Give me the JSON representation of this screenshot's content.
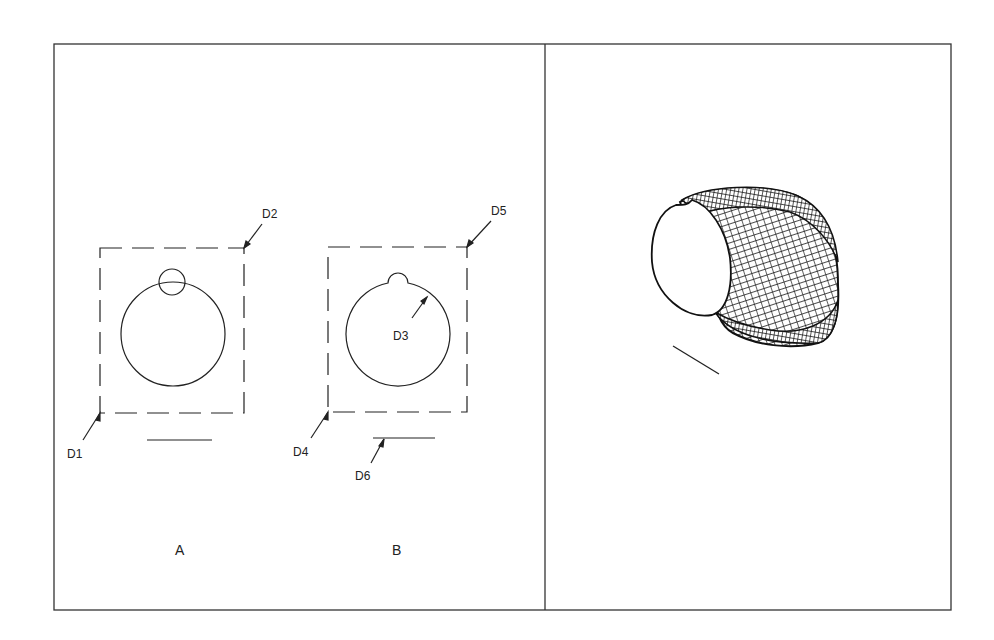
{
  "figure": {
    "panels": [
      {
        "id": "left",
        "description": "2D profile construction views A and B"
      },
      {
        "id": "right",
        "description": "3D swept wireframe elbow result"
      }
    ],
    "view_labels": {
      "a": "A",
      "b": "B"
    },
    "pick_points": {
      "d1": "D1",
      "d2": "D2",
      "d3": "D3",
      "d4": "D4",
      "d5": "D5",
      "d6": "D6"
    },
    "colors": {
      "line": "#222222",
      "background": "#ffffff"
    }
  }
}
